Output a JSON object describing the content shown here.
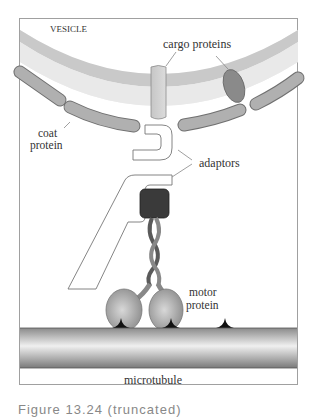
{
  "figure": {
    "labels": {
      "vesicle": "VESICLE",
      "cargo_proteins": "cargo proteins",
      "coat_protein_line1": "coat",
      "coat_protein_line2": "protein",
      "adaptors": "adaptors",
      "motor_protein_line1": "motor",
      "motor_protein_line2": "protein",
      "microtubule": "microtubule"
    },
    "colors": {
      "frame": "#9a9a9a",
      "membrane_outer": "#c8c8c8",
      "membrane_inner": "#e6e6e6",
      "coat_protein": "#a8a8a8",
      "cargo_protein_light": "#d0d0d0",
      "cargo_protein_dark": "#8a8a8a",
      "motor_head": "#999999",
      "motor_cargo_binding": "#333333",
      "microtubule_dark": "#7a7a7a",
      "microtubule_light": "#ececec"
    }
  },
  "caption": {
    "text": "Figure 13.24  (truncated)"
  }
}
